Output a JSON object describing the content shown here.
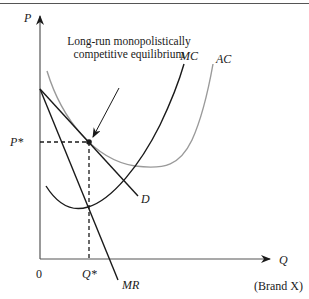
{
  "diagram": {
    "title": "Long-run monopolistically competitive equilibrium",
    "annotation_line1": "Long-run monopolistically",
    "annotation_line2": "competitive equilibrium",
    "y_axis_label": "P",
    "x_axis_label": "Q",
    "x_axis_sublabel": "(Brand X)",
    "origin_label": "0",
    "price_label": "P*",
    "quantity_label": "Q*",
    "curves": {
      "mc": "MC",
      "ac": "AC",
      "demand": "D",
      "mr": "MR"
    },
    "colors": {
      "axis": "#555555",
      "mc": "#1a1a1a",
      "ac": "#9a9a9a",
      "demand": "#1a1a1a",
      "mr": "#1a1a1a",
      "dashed": "#1a1a1a"
    }
  }
}
